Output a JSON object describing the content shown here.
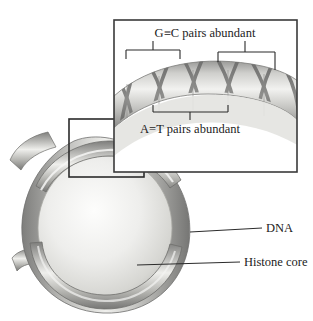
{
  "figure": {
    "background_color": "#ffffff",
    "line_color": "#2b2b2b"
  },
  "inset": {
    "name": "magnified-dna-helix-panel",
    "border_color": "#3a3a3a",
    "top_label": "G≡C pairs abundant",
    "bottom_label": "A=T pairs abundant",
    "brackets": [
      {
        "name": "gc-bracket-left",
        "orientation": "down"
      },
      {
        "name": "gc-bracket-right",
        "orientation": "down"
      },
      {
        "name": "at-bracket-center",
        "orientation": "up"
      }
    ]
  },
  "callouts": [
    {
      "name": "dna-callout",
      "label": "DNA"
    },
    {
      "name": "histone-core-callout",
      "label": "Histone core"
    }
  ],
  "main_illustration": {
    "name": "nucleosome-particle",
    "dna_coil_color": "#9b9b9b",
    "histone_core_color": "#e8e8e6",
    "zoom_box": "magnifier-selection-box"
  }
}
